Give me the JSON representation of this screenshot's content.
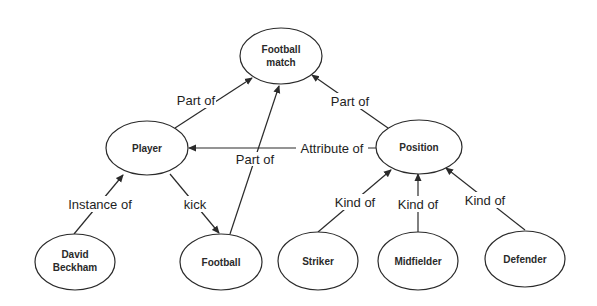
{
  "diagram": {
    "type": "semantic-network",
    "nodes": {
      "football_match": {
        "line1": "Football",
        "line2": "match"
      },
      "player": {
        "label": "Player"
      },
      "position": {
        "label": "Position"
      },
      "david_beckham": {
        "line1": "David",
        "line2": "Beckham"
      },
      "football": {
        "label": "Football"
      },
      "striker": {
        "label": "Striker"
      },
      "midfielder": {
        "label": "Midfielder"
      },
      "defender": {
        "label": "Defender"
      }
    },
    "edges": {
      "player_partof_match": {
        "label": "Part of",
        "from": "Player",
        "to": "Football match"
      },
      "football_partof_match": {
        "label": "Part of",
        "from": "Football",
        "to": "Football match"
      },
      "position_partof_match": {
        "label": "Part of",
        "from": "Position",
        "to": "Football match"
      },
      "position_attributeof_player": {
        "label": "Attribute of",
        "from": "Position",
        "to": "Player"
      },
      "beckham_instanceof_player": {
        "label": "Instance of",
        "from": "David Beckham",
        "to": "Player"
      },
      "player_kick_football": {
        "label": "kick",
        "from": "Player",
        "to": "Football"
      },
      "striker_kindof_position": {
        "label": "Kind of",
        "from": "Striker",
        "to": "Position"
      },
      "midfielder_kindof_position": {
        "label": "Kind of",
        "from": "Midfielder",
        "to": "Position"
      },
      "defender_kindof_position": {
        "label": "Kind of",
        "from": "Defender",
        "to": "Position"
      }
    }
  }
}
